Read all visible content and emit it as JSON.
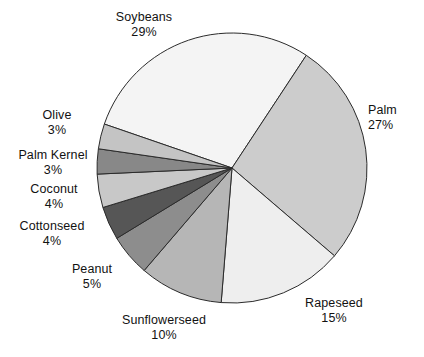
{
  "chart_data": {
    "type": "pie",
    "title": "",
    "subtitle": "",
    "xlabel": "",
    "ylabel": "",
    "legend_position": "none",
    "labels_position": "outside-callout",
    "grid": false,
    "units": "percent",
    "total": 100,
    "categories": [
      "Soybeans",
      "Palm",
      "Rapeseed",
      "Sunflowerseed",
      "Peanut",
      "Cottonseed",
      "Coconut",
      "Palm Kernel",
      "Olive"
    ],
    "values": [
      29,
      27,
      15,
      10,
      5,
      4,
      4,
      3,
      3
    ],
    "slices": [
      {
        "label": "Soybeans",
        "value": 29,
        "value_text": "29%",
        "color": "#f4f4f4",
        "start_angle": 199,
        "end_angle": 303.4
      },
      {
        "label": "Palm",
        "value": 27,
        "value_text": "27%",
        "color": "#cccccc",
        "start_angle": 303.4,
        "end_angle": 400.6
      },
      {
        "label": "Rapeseed",
        "value": 15,
        "value_text": "15%",
        "color": "#eeeeee",
        "start_angle": 400.6,
        "end_angle": 454.6
      },
      {
        "label": "Sunflowerseed",
        "value": 10,
        "value_text": "10%",
        "color": "#b6b6b6",
        "start_angle": 454.6,
        "end_angle": 490.6
      },
      {
        "label": "Peanut",
        "value": 5,
        "value_text": "5%",
        "color": "#8d8d8d",
        "start_angle": 490.6,
        "end_angle": 508.6
      },
      {
        "label": "Cottonseed",
        "value": 4,
        "value_text": "4%",
        "color": "#565656",
        "start_angle": 508.6,
        "end_angle": 523.0
      },
      {
        "label": "Coconut",
        "value": 4,
        "value_text": "4%",
        "color": "#c8c8c8",
        "start_angle": 523.0,
        "end_angle": 537.4
      },
      {
        "label": "Palm Kernel",
        "value": 3,
        "value_text": "3%",
        "color": "#888888",
        "start_angle": 537.4,
        "end_angle": 548.2
      },
      {
        "label": "Olive",
        "value": 3,
        "value_text": "3%",
        "color": "#c4c4c4",
        "start_angle": 548.2,
        "end_angle": 559.0
      }
    ],
    "geometry": {
      "center_x": 232,
      "center_y": 168,
      "radius": 135
    },
    "style": {
      "stroke": "#2b2b2b",
      "stroke_width": 1,
      "background": "#ffffff"
    }
  },
  "labels": {
    "soybeans": {
      "name": "Soybeans",
      "pct": "29%"
    },
    "palm": {
      "name": "Palm",
      "pct": "27%"
    },
    "rapeseed": {
      "name": "Rapeseed",
      "pct": "15%"
    },
    "sunflowerseed": {
      "name": "Sunflowerseed",
      "pct": "10%"
    },
    "peanut": {
      "name": "Peanut",
      "pct": "5%"
    },
    "cottonseed": {
      "name": "Cottonseed",
      "pct": "4%"
    },
    "coconut": {
      "name": "Coconut",
      "pct": "4%"
    },
    "palm_kernel": {
      "name": "Palm Kernel",
      "pct": "3%"
    },
    "olive": {
      "name": "Olive",
      "pct": "3%"
    }
  }
}
